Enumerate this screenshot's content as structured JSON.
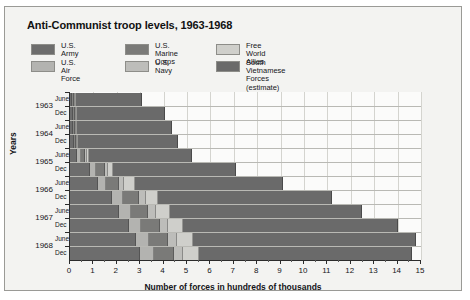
{
  "figure": {
    "title": "Anti-Communist troop levels, 1963-1968",
    "background": "#f3f3f1",
    "border_color": "#9a9a96"
  },
  "legend": {
    "items": [
      {
        "label": "U.S. Army",
        "color": "#6d6d6d"
      },
      {
        "label": "U.S. Air\nForce",
        "color": "#b3b3b0"
      },
      {
        "label": "U.S. Marine\nCorps",
        "color": "#7a7a78"
      },
      {
        "label": "U.S. Navy",
        "color": "#bdbdba"
      },
      {
        "label": "Free World Allies",
        "color": "#cfcfcb"
      },
      {
        "label": "South  Vietnamese\nForces (estimate)",
        "color": "#6a6a6a"
      }
    ]
  },
  "chart_data": {
    "type": "bar",
    "orientation": "horizontal",
    "stacked": true,
    "title": "Anti-Communist troop levels, 1963-1968",
    "xlabel": "Number of forces in hundreds of thousands",
    "ylabel": "Years",
    "xlim": [
      0,
      15
    ],
    "xticks": [
      0,
      1,
      2,
      3,
      4,
      5,
      6,
      7,
      8,
      9,
      10,
      11,
      12,
      13,
      14,
      15
    ],
    "xtick_labels": [
      "0",
      "1",
      "2",
      "3",
      "4",
      "5",
      "6",
      "7",
      "8",
      "9",
      "10",
      "11",
      "12",
      "13",
      "14",
      "15"
    ],
    "grid": "vertical-and-horizontal",
    "legend_position": "top",
    "years": [
      "1963",
      "1964",
      "1965",
      "1966",
      "1967",
      "1968"
    ],
    "periods": [
      "June",
      "Dec"
    ],
    "categories": [
      "1963 June",
      "1963 Dec",
      "1964 June",
      "1964 Dec",
      "1965 June",
      "1965 Dec",
      "1966 June",
      "1966 Dec",
      "1967 June",
      "1967 Dec",
      "1968 June",
      "1968 Dec"
    ],
    "series": [
      {
        "name": "U.S. Army",
        "color": "#6d6d6d",
        "values": [
          0.1,
          0.12,
          0.13,
          0.15,
          0.3,
          0.85,
          1.2,
          1.8,
          2.1,
          2.5,
          2.8,
          3.0
        ]
      },
      {
        "name": "U.S. Air Force",
        "color": "#b3b3b0",
        "values": [
          0.04,
          0.05,
          0.06,
          0.08,
          0.15,
          0.25,
          0.35,
          0.45,
          0.5,
          0.55,
          0.58,
          0.6
        ]
      },
      {
        "name": "U.S. Marine Corps",
        "color": "#7a7a78",
        "values": [
          0.02,
          0.02,
          0.03,
          0.04,
          0.2,
          0.38,
          0.55,
          0.7,
          0.75,
          0.8,
          0.82,
          0.85
        ]
      },
      {
        "name": "U.S. Navy",
        "color": "#bdbdba",
        "values": [
          0.02,
          0.02,
          0.03,
          0.04,
          0.08,
          0.15,
          0.22,
          0.28,
          0.32,
          0.35,
          0.36,
          0.38
        ]
      },
      {
        "name": "Free World Allies",
        "color": "#cfcfcb",
        "values": [
          0.01,
          0.01,
          0.02,
          0.03,
          0.08,
          0.22,
          0.45,
          0.55,
          0.6,
          0.65,
          0.68,
          0.7
        ]
      },
      {
        "name": "South Vietnamese Forces (estimate)",
        "color": "#6a6a6a",
        "values": [
          2.81,
          3.78,
          4.03,
          4.26,
          4.39,
          5.25,
          6.33,
          7.42,
          8.23,
          9.15,
          9.56,
          9.07
        ]
      }
    ],
    "totals": [
      3.0,
      4.0,
      4.3,
      4.6,
      5.2,
      7.1,
      9.1,
      11.2,
      12.5,
      14.0,
      14.8,
      14.6
    ]
  },
  "axis": {
    "x_title": "Number of forces in hundreds of thousands",
    "y_title": "Years"
  }
}
